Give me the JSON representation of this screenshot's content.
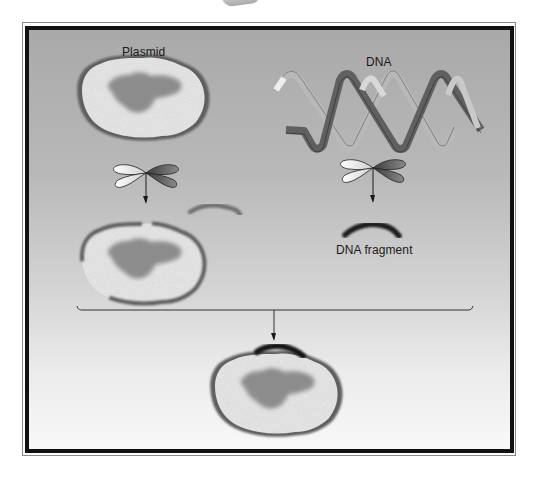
{
  "figure": {
    "type": "diagram",
    "colors": {
      "background_top": "#a9a9a9",
      "background_bottom": "#f8f8f8",
      "frame": "#111111",
      "plasmid_ring": "#5a5a5a",
      "plasmid_fill": "#e6e6e6",
      "plasmid_core": "#8a8a8a",
      "dna_strand_dark": "#555555",
      "dna_strand_light": "#b4b4b4",
      "fragment": "#222222"
    }
  },
  "labels": {
    "plasmid": "Plasmid",
    "dna": "DNA",
    "dna_fragment": "DNA fragment"
  },
  "elements": {
    "left_column": [
      "plasmid",
      "restriction-enzyme",
      "arrow-down",
      "cut-plasmid-with-open-gap"
    ],
    "right_column": [
      "dna-double-helix",
      "restriction-enzyme",
      "arrow-down",
      "dna-fragment"
    ],
    "merge": [
      "bracket",
      "arrow-down",
      "recombinant-plasmid"
    ]
  }
}
